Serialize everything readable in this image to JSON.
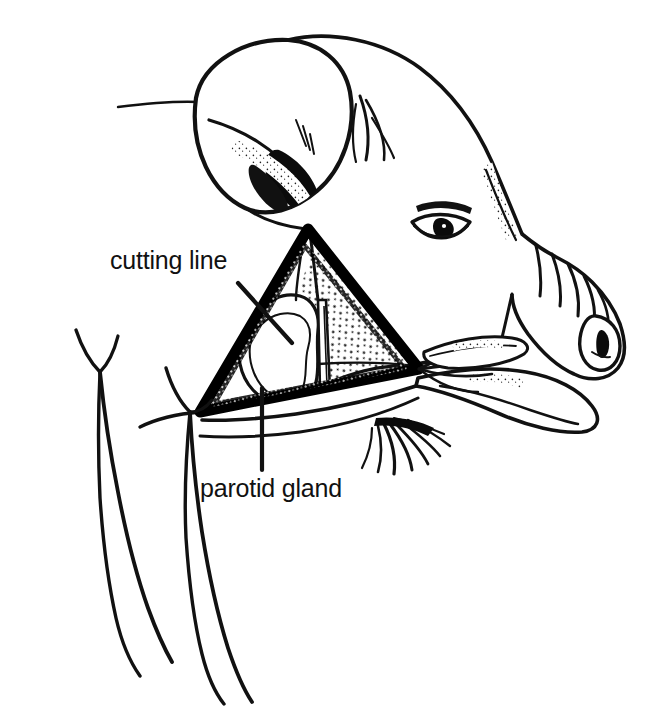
{
  "figure": {
    "view": "lateral",
    "style": "black-and-white line drawing",
    "background_color": "#ffffff",
    "ink_color": "#000000"
  },
  "labels": [
    {
      "id": "cutting-line",
      "text": "cutting line",
      "x": 110,
      "y": 248,
      "leader": {
        "from_x": 238,
        "from_y": 283,
        "to_x": 290,
        "to_y": 340
      }
    },
    {
      "id": "parotid-gland",
      "text": "parotid gland",
      "x": 200,
      "y": 476,
      "leader": {
        "from_x": 262,
        "from_y": 470,
        "to_x": 262,
        "to_y": 388
      }
    }
  ],
  "structures": [
    {
      "id": "ear",
      "name": "ear"
    },
    {
      "id": "eye",
      "name": "eye"
    },
    {
      "id": "snout",
      "name": "snout"
    },
    {
      "id": "nostril",
      "name": "nostril"
    },
    {
      "id": "lower-jaw",
      "name": "lower jaw"
    },
    {
      "id": "chin-bristles",
      "name": "chin bristles"
    },
    {
      "id": "forelimbs",
      "name": "forelimbs"
    },
    {
      "id": "cutting-triangle",
      "name": "triangular cutting line"
    },
    {
      "id": "parotid-gland-shape",
      "name": "parotid gland"
    },
    {
      "id": "masseter-muscle",
      "name": "masseter muscle striations"
    },
    {
      "id": "ducts-vessels",
      "name": "ducts and vessels"
    }
  ],
  "colors": {
    "ink": "#000000",
    "paper": "#ffffff",
    "label": "#111111"
  }
}
